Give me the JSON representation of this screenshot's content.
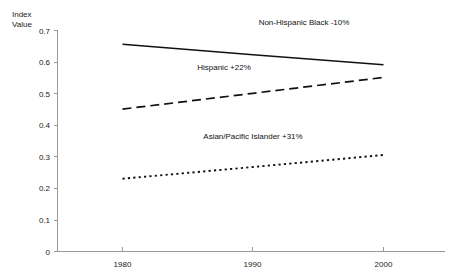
{
  "chart_data": {
    "type": "line",
    "title": "",
    "xlabel": "",
    "ylabel": "Index Value",
    "ylabel_line1": "Index",
    "ylabel_line2": "Value",
    "x": [
      1980,
      1990,
      2000
    ],
    "categories": [
      "1980",
      "1990",
      "2000"
    ],
    "xlim": [
      1975,
      2004
    ],
    "ylim": [
      0,
      0.7
    ],
    "yticks": [
      "0.7",
      "0.6",
      "0.5",
      "0.4",
      "0.3",
      "0.2",
      "0.1",
      "0"
    ],
    "ytick_values": [
      0.7,
      0.6,
      0.5,
      0.4,
      0.3,
      0.2,
      0.1,
      0
    ],
    "xticks": [
      "1980",
      "1990",
      "2000"
    ],
    "grid": false,
    "legend_position": "inline-annotations",
    "series": [
      {
        "name": "Non-Hispanic Black -10%",
        "style": "solid",
        "label": "Non-Hispanic Black -10%",
        "change": "-10%",
        "values": [
          0.655,
          0.622,
          0.59
        ],
        "x": [
          1980,
          1990,
          2000
        ]
      },
      {
        "name": "Hispanic +22%",
        "style": "dashed",
        "label": "Hispanic +22%",
        "change": "+22%",
        "values": [
          0.45,
          0.5,
          0.55
        ],
        "x": [
          1980,
          1990,
          2000
        ]
      },
      {
        "name": "Asian/Pacific Islander +31%",
        "style": "dotted",
        "label": "Asian/Pacific Islander +31%",
        "change": "+31%",
        "values": [
          0.23,
          0.267,
          0.305
        ],
        "x": [
          1980,
          1990,
          2000
        ]
      }
    ],
    "annotations": [
      {
        "text": "Non-Hispanic Black -10%",
        "x": 1995,
        "y": 0.675
      },
      {
        "text": "Hispanic +22%",
        "x": 1984.5,
        "y": 0.565
      },
      {
        "text": "Asian/Pacific Islander +31%",
        "x": 1991.5,
        "y": 0.345
      }
    ],
    "colors": {
      "line": "#111111",
      "axis": "#9a9a9a",
      "text": "#1a1a1a",
      "background": "#ffffff"
    }
  }
}
